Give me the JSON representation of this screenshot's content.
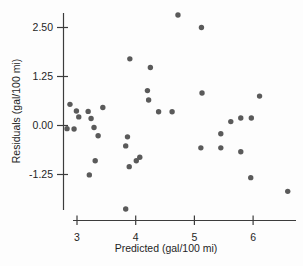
{
  "chart_data": {
    "type": "scatter",
    "title": "",
    "xlabel": "Predicted (gal/100 mi)",
    "ylabel": "Residuals (gal/100 mi)",
    "xlim": [
      2.7,
      6.8
    ],
    "ylim": [
      -2.45,
      2.95
    ],
    "grid": false,
    "legend": false,
    "axis_color": "#3c3c3c",
    "text_color": "#1f1f1f",
    "marker": {
      "shape": "circle",
      "color": "#4c4c4c",
      "radius_px": 2.7
    },
    "x_ticks": [
      {
        "value": 3,
        "label": "3"
      },
      {
        "value": 4,
        "label": "4"
      },
      {
        "value": 5,
        "label": "5"
      },
      {
        "value": 6,
        "label": "6"
      }
    ],
    "y_ticks": [
      {
        "value": -1.25,
        "label": "-1.25"
      },
      {
        "value": 0,
        "label": "0.00"
      },
      {
        "value": 1.25,
        "label": "1.25"
      },
      {
        "value": 2.5,
        "label": "2.50"
      }
    ],
    "points": [
      {
        "x": 4.72,
        "y": 2.82
      },
      {
        "x": 5.12,
        "y": 2.5
      },
      {
        "x": 3.9,
        "y": 1.7
      },
      {
        "x": 4.25,
        "y": 1.48
      },
      {
        "x": 4.2,
        "y": 0.89
      },
      {
        "x": 4.22,
        "y": 0.65
      },
      {
        "x": 5.13,
        "y": 0.83
      },
      {
        "x": 6.11,
        "y": 0.75
      },
      {
        "x": 2.88,
        "y": 0.54
      },
      {
        "x": 2.99,
        "y": 0.37
      },
      {
        "x": 3.44,
        "y": 0.46
      },
      {
        "x": 3.19,
        "y": 0.36
      },
      {
        "x": 3.03,
        "y": 0.22
      },
      {
        "x": 3.24,
        "y": 0.18
      },
      {
        "x": 2.83,
        "y": -0.08
      },
      {
        "x": 2.95,
        "y": -0.09
      },
      {
        "x": 3.29,
        "y": -0.05
      },
      {
        "x": 3.36,
        "y": -0.26
      },
      {
        "x": 4.39,
        "y": 0.35
      },
      {
        "x": 4.62,
        "y": 0.35
      },
      {
        "x": 3.86,
        "y": -0.29
      },
      {
        "x": 3.83,
        "y": -0.52
      },
      {
        "x": 4.07,
        "y": -0.81
      },
      {
        "x": 4.01,
        "y": -0.9
      },
      {
        "x": 3.89,
        "y": -1.05
      },
      {
        "x": 3.31,
        "y": -0.9
      },
      {
        "x": 3.21,
        "y": -1.26
      },
      {
        "x": 5.11,
        "y": -0.57
      },
      {
        "x": 5.45,
        "y": -0.21
      },
      {
        "x": 5.45,
        "y": -0.57
      },
      {
        "x": 5.62,
        "y": 0.1
      },
      {
        "x": 5.79,
        "y": 0.19
      },
      {
        "x": 5.97,
        "y": 0.19
      },
      {
        "x": 5.79,
        "y": -0.67
      },
      {
        "x": 5.96,
        "y": -1.33
      },
      {
        "x": 6.59,
        "y": -1.68
      },
      {
        "x": 3.83,
        "y": -2.13
      }
    ]
  }
}
